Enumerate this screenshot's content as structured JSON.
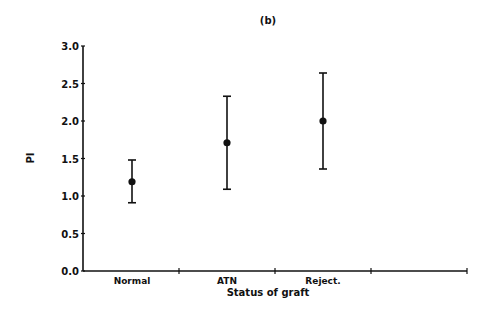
{
  "chart_data": {
    "type": "scatter",
    "subtype": "error-bar",
    "title": "(b)",
    "xlabel": "Status of graft",
    "ylabel": "PI",
    "categories": [
      "Normal",
      "ATN",
      "Reject."
    ],
    "values": [
      1.19,
      1.71,
      2.0
    ],
    "error_upper": [
      1.48,
      2.33,
      2.64
    ],
    "error_lower": [
      0.91,
      1.09,
      1.36
    ],
    "ylim": [
      0.0,
      3.0
    ],
    "yticks": [
      "0.0",
      "0.5",
      "1.0",
      "1.5",
      "2.0",
      "2.5",
      "3.0"
    ],
    "xticks_count": 4,
    "grid": false,
    "legend": null
  }
}
